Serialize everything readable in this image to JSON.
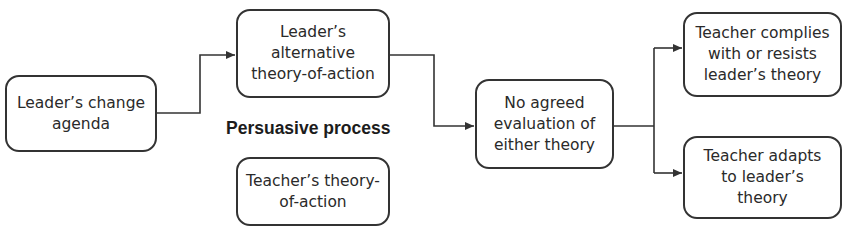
{
  "diagram": {
    "type": "flowchart",
    "nodes": [
      {
        "id": "change_agenda",
        "text": "Leader’s change\nagenda"
      },
      {
        "id": "leader_theory",
        "text": "Leader’s\nalternative\ntheory-of-action"
      },
      {
        "id": "teacher_theory",
        "text": "Teacher’s theory-\nof-action"
      },
      {
        "id": "no_agreed_eval",
        "text": "No agreed\nevaluation of\neither theory"
      },
      {
        "id": "complies_resists",
        "text": "Teacher complies\nwith or resists\nleader’s theory"
      },
      {
        "id": "adapts",
        "text": "Teacher adapts\nto leader’s\ntheory"
      }
    ],
    "label": {
      "text": "Persuasive process"
    },
    "edges": [
      {
        "from": "change_agenda",
        "to": "leader_theory"
      },
      {
        "from": "leader_theory",
        "to": "no_agreed_eval"
      },
      {
        "from": "no_agreed_eval",
        "to": "complies_resists"
      },
      {
        "from": "no_agreed_eval",
        "to": "adapts"
      }
    ],
    "colors": {
      "stroke": "#333333",
      "text": "#2a2a2a",
      "background": "#ffffff"
    }
  }
}
